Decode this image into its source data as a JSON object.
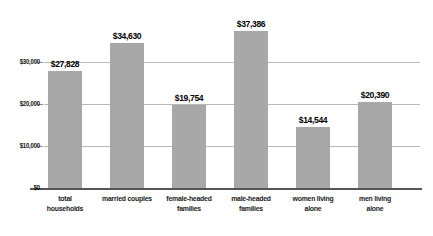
{
  "chart_data": {
    "type": "bar",
    "title": "",
    "subtitle": "",
    "xlabel": "",
    "ylabel": "",
    "ylim": [
      0,
      40000
    ],
    "grid": true,
    "legend": null,
    "orientation": "vertical",
    "bar_color": "#a8a8a8",
    "gridline_color": "#b9b9b9",
    "axis_color": "#555555",
    "categories": [
      "total households",
      "married couples",
      "female-headed families",
      "male-headed families",
      "women living alone",
      "men living alone"
    ],
    "category_lines": [
      [
        "total",
        "households"
      ],
      [
        "married couples",
        ""
      ],
      [
        "female-headed",
        "families"
      ],
      [
        "male-headed",
        "families"
      ],
      [
        "women living",
        "alone"
      ],
      [
        "men living",
        "alone"
      ]
    ],
    "values": [
      27828,
      34630,
      19754,
      37386,
      14544,
      20390
    ],
    "value_labels": [
      "$27,828",
      "$34,630",
      "$19,754",
      "$37,386",
      "$14,544",
      "$20,390"
    ],
    "yticks": [
      0,
      10000,
      20000,
      30000
    ],
    "ytick_labels": [
      "$0",
      "$10,000",
      "$20,000",
      "$30,000"
    ]
  }
}
